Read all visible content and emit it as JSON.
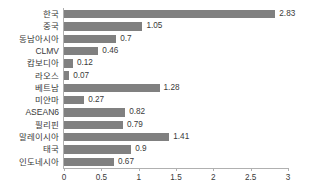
{
  "chart_data": {
    "type": "bar",
    "orientation": "horizontal",
    "title": "",
    "subtitle": "",
    "xlabel": "",
    "ylabel": "",
    "xlim": [
      0,
      3
    ],
    "xticks": [
      0,
      0.5,
      1,
      1.5,
      2,
      2.5,
      3
    ],
    "xtick_labels": [
      "0",
      "0.5",
      "1",
      "1.5",
      "2",
      "2.5",
      "3"
    ],
    "grid": false,
    "legend": false,
    "bar_color": "#808080",
    "categories": [
      "한국",
      "중국",
      "동남아시아",
      "CLMV",
      "캄보디아",
      "라오스",
      "베트남",
      "미얀마",
      "ASEAN6",
      "필리핀",
      "말레이시아",
      "태국",
      "인도네시아"
    ],
    "values": [
      2.83,
      1.05,
      0.7,
      0.46,
      0.12,
      0.07,
      1.28,
      0.27,
      0.82,
      0.79,
      1.41,
      0.9,
      0.67
    ],
    "value_labels": [
      "2.83",
      "1.05",
      "0.7",
      "0.46",
      "0.12",
      "0.07",
      "1.28",
      "0.27",
      "0.82",
      "0.79",
      "1.41",
      "0.9",
      "0.67"
    ],
    "rows": [
      {
        "category": "한국",
        "value": 2.83,
        "label": "2.83"
      },
      {
        "category": "중국",
        "value": 1.05,
        "label": "1.05"
      },
      {
        "category": "동남아시아",
        "value": 0.7,
        "label": "0.7"
      },
      {
        "category": "CLMV",
        "value": 0.46,
        "label": "0.46"
      },
      {
        "category": "캄보디아",
        "value": 0.12,
        "label": "0.12"
      },
      {
        "category": "라오스",
        "value": 0.07,
        "label": "0.07"
      },
      {
        "category": "베트남",
        "value": 1.28,
        "label": "1.28"
      },
      {
        "category": "미얀마",
        "value": 0.27,
        "label": "0.27"
      },
      {
        "category": "ASEAN6",
        "value": 0.82,
        "label": "0.82"
      },
      {
        "category": "필리핀",
        "value": 0.79,
        "label": "0.79"
      },
      {
        "category": "말레이시아",
        "value": 1.41,
        "label": "1.41"
      },
      {
        "category": "태국",
        "value": 0.9,
        "label": "0.9"
      },
      {
        "category": "인도네시아",
        "value": 0.67,
        "label": "0.67"
      }
    ]
  }
}
